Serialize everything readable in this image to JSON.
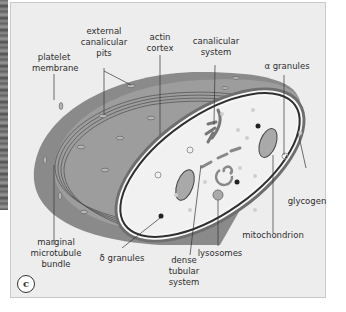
{
  "figure": {
    "panel_letter": "c",
    "colors": {
      "background": "#ededed",
      "platelet_body": "#8a8a8a",
      "platelet_top": "#9d9d9d",
      "cytoplasm": "#f4f4f4",
      "membrane_dark": "#3a3a3a",
      "granule_light": "#c8c8c8",
      "dense_granule": "#222222"
    }
  },
  "labels": {
    "platelet_membrane": "platelet\nmembrane",
    "external_canalicular_pits": "external\ncanalicular\npits",
    "actin_cortex": "actin\ncortex",
    "canalicular_system": "canalicular\nsystem",
    "alpha_granules": "α granules",
    "glycogen": "glycogen",
    "mitochondrion": "mitochondrion",
    "lysosomes": "lysosomes",
    "dense_tubular_system": "dense\ntubular\nsystem",
    "delta_granules": "δ granules",
    "marginal_microtubule_bundle": "marginal\nmicrotubule\nbundle"
  }
}
